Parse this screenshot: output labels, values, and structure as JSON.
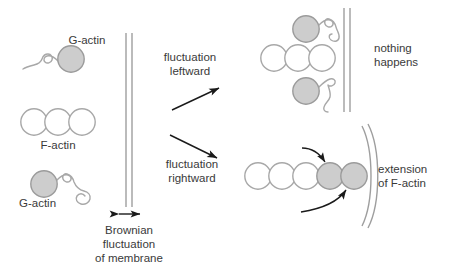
{
  "figure": {
    "type": "diagram",
    "topic": "Brownian ratchet model of actin-driven membrane protrusion",
    "colors": {
      "text": "#3a3a3a",
      "monomer_fill": "#cdcdcd",
      "monomer_stroke": "#9b9b9b",
      "filament_fill": "#ffffff",
      "filament_stroke": "#a8a8a8",
      "membrane": "#9e9e9e",
      "arrow": "#1a1a1a",
      "background": "#ffffff"
    }
  },
  "left_panel": {
    "g_actin_top_label": "G-actin",
    "f_actin_label": "F-actin",
    "g_actin_bottom_label": "G-actin",
    "membrane_caption_line1": "Brownian",
    "membrane_caption_line2": "fluctuation",
    "membrane_caption_line3": "of membrane",
    "f_actin_subunit_count": 3,
    "g_actin_count": 2
  },
  "transitions": {
    "upper_line1": "fluctuation",
    "upper_line2": "leftward",
    "lower_line1": "fluctuation",
    "lower_line2": "rightward"
  },
  "top_right_panel": {
    "outcome_line1": "nothing",
    "outcome_line2": "happens",
    "f_actin_subunit_count": 3,
    "g_actin_count": 2
  },
  "bottom_right_panel": {
    "outcome_line1": "extension",
    "outcome_line2": "of F-actin",
    "f_actin_subunit_count": 3,
    "added_monomer_count": 2,
    "incoming_arrow_count": 2
  }
}
